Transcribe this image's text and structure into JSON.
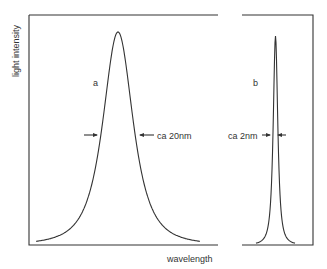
{
  "chart_data": {
    "type": "line",
    "title": "",
    "xlabel": "wavelength",
    "ylabel": "light intensity",
    "grid": false,
    "panels": [
      {
        "label": "a",
        "shape": "broad peak",
        "annotation": "ca 20nm",
        "fwhm_nm": 20
      },
      {
        "label": "b",
        "shape": "narrow peak",
        "annotation": "ca 2nm",
        "fwhm_nm": 2
      }
    ]
  }
}
